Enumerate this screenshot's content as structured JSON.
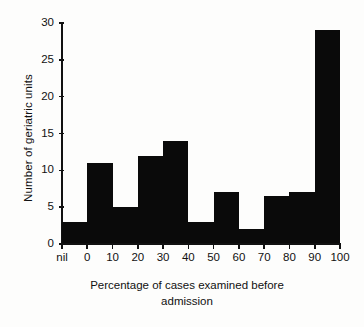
{
  "chart_data": {
    "type": "bar",
    "title": "",
    "xlabel": "Percentage of cases examined before admission",
    "xlabel_line1": "Percentage of cases examined before",
    "xlabel_line2": "admission",
    "ylabel": "Number of geriatric units",
    "categories": [
      "nil",
      "0-10",
      "10-20",
      "20-30",
      "30-40",
      "40-50",
      "50-60",
      "60-70",
      "70-80",
      "80-90",
      "90-100"
    ],
    "values": [
      3,
      11,
      5,
      12,
      14,
      3,
      7,
      2,
      6.5,
      7,
      29
    ],
    "ylim": [
      0,
      30
    ],
    "xlim": [
      -10,
      100
    ],
    "yticks": [
      0,
      5,
      10,
      15,
      20,
      25,
      30
    ],
    "ytick_labels": [
      "0",
      "5",
      "10",
      "15",
      "20",
      "25",
      "30"
    ],
    "xticks": [
      -10,
      0,
      10,
      20,
      30,
      40,
      50,
      60,
      70,
      80,
      90,
      100
    ],
    "xtick_labels": [
      "nil",
      "0",
      "10",
      "20",
      "30",
      "40",
      "50",
      "60",
      "70",
      "80",
      "90",
      "100"
    ],
    "grid": false,
    "legend": false,
    "bar_color": "#0a0a0a",
    "axis_color": "#111111",
    "background_color": "#fdfdfc"
  }
}
